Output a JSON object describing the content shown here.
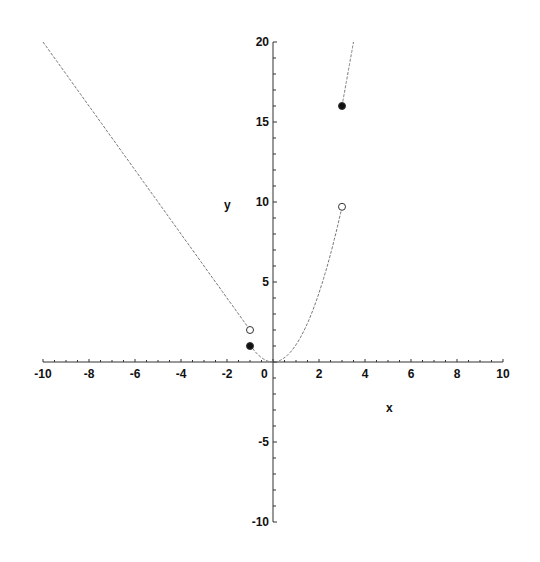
{
  "chart_data": {
    "type": "line",
    "title": "",
    "xlabel": "x",
    "ylabel": "y",
    "xlim": [
      -10,
      10
    ],
    "ylim": [
      -10,
      20
    ],
    "x_ticks": [
      -10,
      -8,
      -6,
      -4,
      -2,
      0,
      2,
      4,
      6,
      8,
      10
    ],
    "y_ticks": [
      -10,
      -5,
      5,
      10,
      15,
      20
    ],
    "grid": false,
    "legend": null,
    "series": [
      {
        "name": "piece-left",
        "expr": "y = -2x",
        "domain": [
          -10,
          -1
        ],
        "points": [
          [
            -10,
            20
          ],
          [
            -1,
            2
          ]
        ]
      },
      {
        "name": "piece-middle",
        "expr": "y = x^2",
        "domain": [
          -1,
          3
        ],
        "points": [
          [
            -1,
            1
          ],
          [
            0,
            0
          ],
          [
            1,
            1
          ],
          [
            2,
            4
          ],
          [
            3,
            9.7
          ]
        ]
      },
      {
        "name": "piece-right",
        "expr": "y ≈ 8x - 8",
        "domain": [
          3,
          3.5
        ],
        "points": [
          [
            3,
            16
          ],
          [
            3.5,
            20
          ]
        ]
      }
    ],
    "markers": [
      {
        "x": -1,
        "y": 2,
        "style": "open"
      },
      {
        "x": -1,
        "y": 1,
        "style": "filled"
      },
      {
        "x": 3,
        "y": 9.7,
        "style": "open"
      },
      {
        "x": 3,
        "y": 16,
        "style": "filled"
      }
    ]
  }
}
